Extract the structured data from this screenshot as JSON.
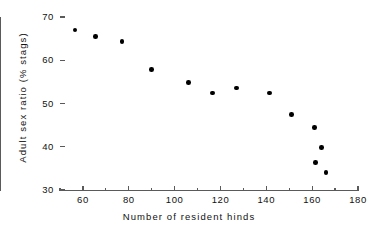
{
  "chart_data": {
    "type": "scatter",
    "title": "",
    "xlabel": "Number of resident hinds",
    "ylabel": "Adult sex ratio (% stags)",
    "xlim": [
      50,
      180
    ],
    "ylim": [
      30,
      70
    ],
    "grid": false,
    "legend": null,
    "x_ticks": [
      60,
      80,
      100,
      120,
      140,
      160,
      180
    ],
    "x_tick_labels": [
      "60",
      "80",
      "100",
      "120",
      "140",
      "160",
      "180"
    ],
    "x_minor_ticks": [
      50,
      70,
      90,
      110,
      130,
      150,
      170
    ],
    "y_ticks": [
      30,
      40,
      50,
      60,
      70
    ],
    "y_tick_labels": [
      "30",
      "40",
      "50",
      "60",
      "70"
    ],
    "marker": "filled-circle",
    "marker_color": "#000000",
    "axis_color": "#5a5a5a",
    "points": [
      {
        "x": 56.5,
        "y": 67.0
      },
      {
        "x": 65.5,
        "y": 65.5
      },
      {
        "x": 77.0,
        "y": 64.4
      },
      {
        "x": 90.0,
        "y": 57.8
      },
      {
        "x": 106.0,
        "y": 54.9
      },
      {
        "x": 116.5,
        "y": 52.4
      },
      {
        "x": 127.0,
        "y": 53.6
      },
      {
        "x": 141.5,
        "y": 52.4
      },
      {
        "x": 151.0,
        "y": 47.4
      },
      {
        "x": 161.0,
        "y": 44.4
      },
      {
        "x": 164.0,
        "y": 39.8
      },
      {
        "x": 161.5,
        "y": 36.4
      },
      {
        "x": 166.0,
        "y": 34.1
      }
    ]
  }
}
